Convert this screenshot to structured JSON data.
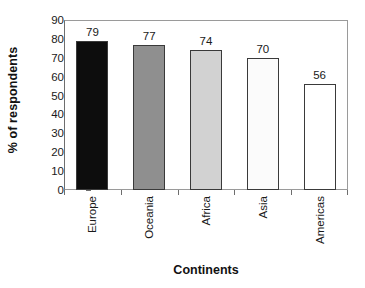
{
  "chart_data": {
    "type": "bar",
    "title": "",
    "xlabel": "Continents",
    "ylabel": "% of respondents",
    "categories": [
      "Europe",
      "Oceania",
      "Africa",
      "Asia",
      "Americas"
    ],
    "values": [
      79,
      77,
      74,
      70,
      56
    ],
    "value_labels": [
      "79",
      "77",
      "74",
      "70",
      "56"
    ],
    "ylim": [
      0,
      90
    ],
    "ytick_values": [
      0,
      10,
      20,
      30,
      40,
      50,
      60,
      70,
      80,
      90
    ],
    "ytick_labels": [
      "0",
      "10",
      "20",
      "30",
      "40",
      "50",
      "60",
      "70",
      "80",
      "90"
    ],
    "grid": false,
    "legend": null,
    "bar_colors": [
      "#0d0d0d",
      "#8f8f8f",
      "#d2d2d2",
      "#fbfbfb",
      "#ffffff"
    ],
    "bar_border_color": "#3a3a3a",
    "axis_color": "#6e6e6e",
    "frame_color": "#9a9a9a",
    "background": "#ffffff",
    "text_color": "#1a1a1a"
  }
}
